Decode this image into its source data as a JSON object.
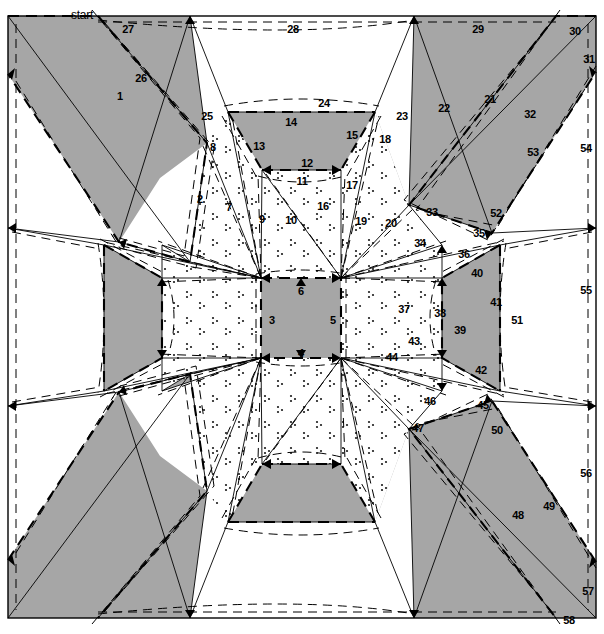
{
  "figure": {
    "title": "start",
    "kind": "origami-crease-pattern",
    "canvas": {
      "width": 604,
      "height": 634
    },
    "colors": {
      "shade_fill": "#a6a6a6",
      "shade_fill_light": "#ffffff",
      "line": "#000000",
      "background": "#ffffff"
    },
    "border": {
      "x": 8,
      "y": 16,
      "width": 588,
      "height": 608
    }
  },
  "start_label": {
    "text": "start",
    "x": 82,
    "y": 8
  },
  "crease_labels": [
    {
      "n": "1",
      "x": 120,
      "y": 96
    },
    {
      "n": "2",
      "x": 200,
      "y": 199
    },
    {
      "n": "3",
      "x": 272,
      "y": 320
    },
    {
      "n": "4",
      "x": 301,
      "y": 353
    },
    {
      "n": "5",
      "x": 333,
      "y": 320
    },
    {
      "n": "6",
      "x": 301,
      "y": 291
    },
    {
      "n": "7",
      "x": 229,
      "y": 207
    },
    {
      "n": "8",
      "x": 213,
      "y": 147
    },
    {
      "n": "9",
      "x": 262,
      "y": 219
    },
    {
      "n": "10",
      "x": 291,
      "y": 220
    },
    {
      "n": "11",
      "x": 302,
      "y": 181
    },
    {
      "n": "12",
      "x": 307,
      "y": 163
    },
    {
      "n": "13",
      "x": 259,
      "y": 146
    },
    {
      "n": "14",
      "x": 291,
      "y": 122
    },
    {
      "n": "15",
      "x": 352,
      "y": 135
    },
    {
      "n": "16",
      "x": 323,
      "y": 206
    },
    {
      "n": "17",
      "x": 352,
      "y": 185
    },
    {
      "n": "18",
      "x": 385,
      "y": 139
    },
    {
      "n": "19",
      "x": 361,
      "y": 221
    },
    {
      "n": "20",
      "x": 391,
      "y": 223
    },
    {
      "n": "21",
      "x": 490,
      "y": 99
    },
    {
      "n": "22",
      "x": 444,
      "y": 108
    },
    {
      "n": "23",
      "x": 402,
      "y": 116
    },
    {
      "n": "24",
      "x": 324,
      "y": 103
    },
    {
      "n": "25",
      "x": 207,
      "y": 116
    },
    {
      "n": "26",
      "x": 141,
      "y": 78
    },
    {
      "n": "27",
      "x": 128,
      "y": 29
    },
    {
      "n": "28",
      "x": 293,
      "y": 29
    },
    {
      "n": "29",
      "x": 478,
      "y": 29
    },
    {
      "n": "30",
      "x": 575,
      "y": 31
    },
    {
      "n": "31",
      "x": 589,
      "y": 59
    },
    {
      "n": "32",
      "x": 530,
      "y": 114
    },
    {
      "n": "33",
      "x": 432,
      "y": 212
    },
    {
      "n": "34",
      "x": 420,
      "y": 243
    },
    {
      "n": "35",
      "x": 479,
      "y": 233
    },
    {
      "n": "36",
      "x": 464,
      "y": 254
    },
    {
      "n": "37",
      "x": 404,
      "y": 309
    },
    {
      "n": "38",
      "x": 440,
      "y": 313
    },
    {
      "n": "39",
      "x": 460,
      "y": 330
    },
    {
      "n": "40",
      "x": 477,
      "y": 273
    },
    {
      "n": "41",
      "x": 496,
      "y": 302
    },
    {
      "n": "42",
      "x": 481,
      "y": 370
    },
    {
      "n": "43",
      "x": 414,
      "y": 341
    },
    {
      "n": "44",
      "x": 392,
      "y": 357
    },
    {
      "n": "45",
      "x": 483,
      "y": 405
    },
    {
      "n": "46",
      "x": 430,
      "y": 401
    },
    {
      "n": "47",
      "x": 418,
      "y": 428
    },
    {
      "n": "48",
      "x": 518,
      "y": 515
    },
    {
      "n": "49",
      "x": 549,
      "y": 506
    },
    {
      "n": "50",
      "x": 497,
      "y": 430
    },
    {
      "n": "51",
      "x": 517,
      "y": 320
    },
    {
      "n": "52",
      "x": 496,
      "y": 213
    },
    {
      "n": "53",
      "x": 533,
      "y": 152
    },
    {
      "n": "54",
      "x": 586,
      "y": 148
    },
    {
      "n": "55",
      "x": 586,
      "y": 290
    },
    {
      "n": "56",
      "x": 586,
      "y": 473
    },
    {
      "n": "57",
      "x": 588,
      "y": 591
    },
    {
      "n": "58",
      "x": 569,
      "y": 620
    }
  ],
  "geometry_notes": {
    "center_square": {
      "left": 261,
      "top": 278,
      "right": 341,
      "bottom": 358
    },
    "symmetry": "4-fold (horizontal, vertical and diagonal mirrors); only the top and right quadrants carry printed numbers",
    "line_styles": [
      "solid thin",
      "dashed bold",
      "dashed thin"
    ]
  }
}
